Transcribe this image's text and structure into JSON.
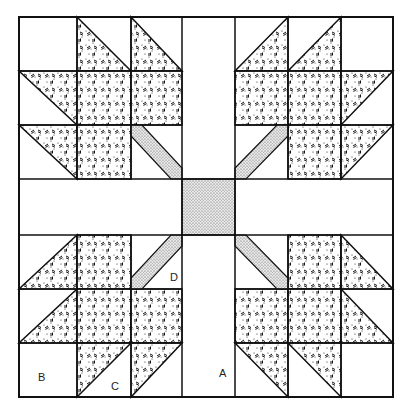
{
  "grid": {
    "cols_x": [
      19,
      77,
      131,
      182,
      235,
      288,
      341,
      393
    ],
    "rows_y": [
      17,
      71,
      125,
      179,
      235,
      289,
      343,
      397
    ]
  },
  "labels": [
    {
      "id": "A",
      "text": "A",
      "x": 219,
      "y": 367
    },
    {
      "id": "B",
      "text": "B",
      "x": 38,
      "y": 371
    },
    {
      "id": "C",
      "text": "C",
      "x": 111,
      "y": 380
    },
    {
      "id": "D",
      "text": "D",
      "x": 170,
      "y": 271
    }
  ],
  "fabrics": {
    "background": "#ffffff",
    "leaf": "print-dash-dot",
    "stem_and_center": "fine-dot-gray",
    "line": "#111111"
  }
}
